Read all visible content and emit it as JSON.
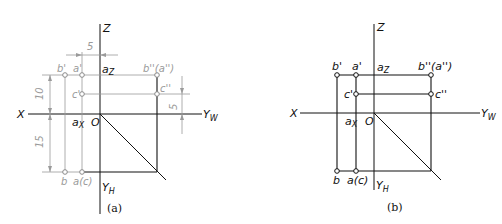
{
  "figure_a": {
    "caption": "(a)",
    "axes": {
      "z": "Z",
      "x": "X",
      "yw": "Y",
      "yw_sub": "W",
      "yh": "Y",
      "yh_sub": "H",
      "origin": "O",
      "az": "a",
      "az_sub": "Z",
      "ax": "a",
      "ax_sub": "X"
    },
    "points": {
      "b_prime": "b'",
      "a_prime": "a'",
      "c_prime": "c'",
      "b_dprime": "b''(a'')",
      "c_dprime": "c''",
      "b": "b",
      "a_c": "a(c)"
    },
    "dimensions": {
      "top": "5",
      "left_upper": "10",
      "left_lower": "15",
      "right": "5"
    }
  },
  "figure_b": {
    "caption": "(b)",
    "axes": {
      "z": "Z",
      "x": "X",
      "yw": "Y",
      "yw_sub": "W",
      "yh": "Y",
      "yh_sub": "H",
      "origin": "O",
      "az": "a",
      "az_sub": "Z",
      "ax": "a",
      "ax_sub": "X"
    },
    "points": {
      "b_prime": "b'",
      "a_prime": "a'",
      "c_prime": "c'",
      "b_dprime": "b''(a'')",
      "c_dprime": "c''",
      "b": "b",
      "a_c": "a(c)"
    }
  }
}
